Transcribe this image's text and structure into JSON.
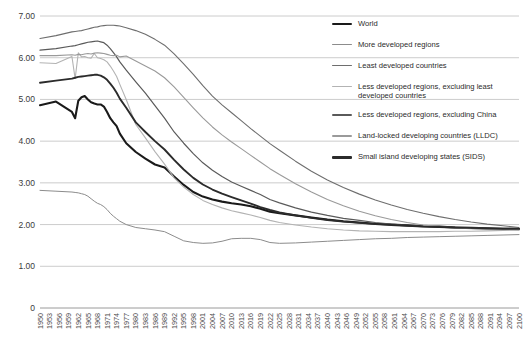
{
  "chart_data": {
    "type": "line",
    "title": "",
    "subtitle": "",
    "xlabel": "",
    "ylabel": "",
    "grid": true,
    "legend_position": "right-top",
    "ylim": [
      0.0,
      7.0
    ],
    "ytick_labels": [
      "7.00",
      "6.00",
      "5.00",
      "4.00",
      "3.00",
      "2.00",
      "1.00",
      "0"
    ],
    "ytick_values": [
      7.0,
      6.0,
      5.0,
      4.0,
      3.0,
      2.0,
      1.0,
      0.0
    ],
    "xlim": [
      1950,
      2100
    ],
    "x_tick_step": 3,
    "xtick_labels": [
      "1950",
      "1953",
      "1956",
      "1959",
      "1962",
      "1965",
      "1968",
      "1971",
      "1974",
      "1977",
      "1980",
      "1983",
      "1986",
      "1989",
      "1992",
      "1995",
      "1998",
      "2001",
      "2004",
      "2007",
      "2010",
      "2013",
      "2016",
      "2019",
      "2022",
      "2025",
      "2028",
      "2031",
      "2034",
      "2037",
      "2040",
      "2043",
      "2046",
      "2049",
      "2052",
      "2055",
      "2058",
      "2061",
      "2064",
      "2067",
      "2070",
      "2073",
      "2076",
      "2079",
      "2082",
      "2085",
      "2088",
      "2091",
      "2094",
      "2097",
      "2100"
    ],
    "x": [
      1950,
      1955,
      1960,
      1961,
      1962,
      1963,
      1964,
      1965,
      1966,
      1967,
      1968,
      1969,
      1970,
      1971,
      1972,
      1973,
      1974,
      1975,
      1977,
      1980,
      1983,
      1986,
      1989,
      1992,
      1995,
      1998,
      2001,
      2004,
      2007,
      2010,
      2013,
      2016,
      2019,
      2022,
      2025,
      2030,
      2035,
      2040,
      2045,
      2050,
      2055,
      2060,
      2065,
      2070,
      2075,
      2080,
      2085,
      2090,
      2095,
      2100
    ],
    "series": [
      {
        "name": "World",
        "color": "#1a1a1a",
        "width": 2.1,
        "values": [
          4.86,
          4.95,
          4.7,
          4.55,
          4.97,
          5.05,
          5.08,
          5.0,
          4.93,
          4.9,
          4.88,
          4.88,
          4.83,
          4.7,
          4.55,
          4.45,
          4.36,
          4.18,
          3.95,
          3.74,
          3.58,
          3.44,
          3.37,
          3.15,
          2.95,
          2.78,
          2.67,
          2.6,
          2.55,
          2.51,
          2.48,
          2.44,
          2.38,
          2.31,
          2.27,
          2.22,
          2.17,
          2.12,
          2.08,
          2.05,
          2.02,
          2.0,
          1.98,
          1.96,
          1.95,
          1.93,
          1.92,
          1.91,
          1.9,
          1.89
        ]
      },
      {
        "name": "More developed regions",
        "color": "#8c8c8c",
        "width": 1.0,
        "values": [
          2.82,
          2.8,
          2.78,
          2.77,
          2.76,
          2.74,
          2.72,
          2.68,
          2.62,
          2.56,
          2.51,
          2.48,
          2.43,
          2.36,
          2.27,
          2.2,
          2.14,
          2.08,
          2.0,
          1.93,
          1.9,
          1.87,
          1.83,
          1.72,
          1.61,
          1.57,
          1.55,
          1.56,
          1.6,
          1.66,
          1.67,
          1.67,
          1.64,
          1.57,
          1.55,
          1.56,
          1.58,
          1.6,
          1.62,
          1.64,
          1.66,
          1.67,
          1.69,
          1.7,
          1.71,
          1.72,
          1.73,
          1.74,
          1.75,
          1.76
        ]
      },
      {
        "name": "Least developed countries",
        "color": "#6e6e6e",
        "width": 1.1,
        "values": [
          6.46,
          6.53,
          6.62,
          6.63,
          6.64,
          6.65,
          6.67,
          6.69,
          6.71,
          6.73,
          6.74,
          6.76,
          6.77,
          6.78,
          6.78,
          6.78,
          6.77,
          6.76,
          6.72,
          6.65,
          6.56,
          6.44,
          6.3,
          6.09,
          5.85,
          5.6,
          5.33,
          5.08,
          4.87,
          4.68,
          4.49,
          4.3,
          4.12,
          3.94,
          3.78,
          3.52,
          3.28,
          3.07,
          2.89,
          2.73,
          2.59,
          2.47,
          2.36,
          2.27,
          2.19,
          2.12,
          2.06,
          2.01,
          1.97,
          1.93
        ]
      },
      {
        "name": "Less developed regions, excluding least\ndeveloped countries",
        "color": "#b3b3b3",
        "width": 1.1,
        "values": [
          5.88,
          5.86,
          6.03,
          5.5,
          6.12,
          6.02,
          6.03,
          6.0,
          5.99,
          6.1,
          6.0,
          5.98,
          5.95,
          5.9,
          5.8,
          5.68,
          5.55,
          5.36,
          5.0,
          4.4,
          4.08,
          3.75,
          3.45,
          3.12,
          2.9,
          2.72,
          2.58,
          2.48,
          2.4,
          2.33,
          2.28,
          2.23,
          2.17,
          2.1,
          2.05,
          1.99,
          1.94,
          1.9,
          1.87,
          1.85,
          1.84,
          1.83,
          1.83,
          1.83,
          1.83,
          1.84,
          1.84,
          1.85,
          1.86,
          1.87
        ]
      },
      {
        "name": "Less developed regions, excluding China",
        "color": "#5a5a5a",
        "width": 1.2,
        "values": [
          6.18,
          6.22,
          6.28,
          6.29,
          6.31,
          6.33,
          6.35,
          6.37,
          6.38,
          6.39,
          6.4,
          6.38,
          6.36,
          6.3,
          6.22,
          6.12,
          6.02,
          5.9,
          5.7,
          5.42,
          5.15,
          4.85,
          4.55,
          4.22,
          3.95,
          3.7,
          3.48,
          3.3,
          3.15,
          3.02,
          2.92,
          2.82,
          2.72,
          2.6,
          2.52,
          2.4,
          2.3,
          2.22,
          2.15,
          2.1,
          2.05,
          2.01,
          1.98,
          1.96,
          1.94,
          1.93,
          1.92,
          1.91,
          1.9,
          1.9
        ]
      },
      {
        "name": "Land-locked developing countries (LLDC)",
        "color": "#9a9a9a",
        "width": 1.1,
        "values": [
          6.05,
          6.05,
          6.07,
          6.06,
          6.08,
          6.07,
          6.09,
          6.1,
          6.09,
          6.11,
          6.12,
          6.11,
          6.1,
          6.08,
          6.06,
          6.05,
          6.06,
          6.02,
          6.04,
          5.92,
          5.8,
          5.68,
          5.52,
          5.3,
          5.05,
          4.8,
          4.56,
          4.34,
          4.15,
          3.98,
          3.82,
          3.66,
          3.5,
          3.34,
          3.2,
          2.98,
          2.78,
          2.6,
          2.45,
          2.32,
          2.21,
          2.12,
          2.05,
          1.99,
          1.95,
          1.92,
          1.9,
          1.89,
          1.88,
          1.88
        ]
      },
      {
        "name": "Small island developing states (SIDS)",
        "color": "#2b2b2b",
        "width": 1.9,
        "values": [
          5.4,
          5.45,
          5.5,
          5.52,
          5.54,
          5.55,
          5.56,
          5.57,
          5.58,
          5.59,
          5.59,
          5.57,
          5.53,
          5.47,
          5.38,
          5.28,
          5.16,
          5.02,
          4.8,
          4.45,
          4.22,
          4.0,
          3.8,
          3.55,
          3.32,
          3.12,
          2.96,
          2.84,
          2.74,
          2.66,
          2.58,
          2.5,
          2.42,
          2.35,
          2.29,
          2.22,
          2.16,
          2.11,
          2.07,
          2.04,
          2.01,
          1.99,
          1.97,
          1.95,
          1.94,
          1.93,
          1.92,
          1.91,
          1.9,
          1.9
        ]
      }
    ]
  },
  "legend": {
    "items": [
      {
        "label": "World",
        "color": "#1a1a1a",
        "thickness": "2.4px"
      },
      {
        "label": "More developed regions",
        "color": "#8c8c8c",
        "thickness": "1.1px"
      },
      {
        "label": "Least developed countries",
        "color": "#6e6e6e",
        "thickness": "1.3px"
      },
      {
        "label": "Less developed regions, excluding least\ndeveloped countries",
        "color": "#b3b3b3",
        "thickness": "1.3px"
      },
      {
        "label": "Less developed regions, excluding China",
        "color": "#5a5a5a",
        "thickness": "1.4px"
      },
      {
        "label": "Land-locked developing countries (LLDC)",
        "color": "#9a9a9a",
        "thickness": "1.3px"
      },
      {
        "label": "Small island developing states (SIDS)",
        "color": "#2b2b2b",
        "thickness": "2.2px"
      }
    ]
  }
}
